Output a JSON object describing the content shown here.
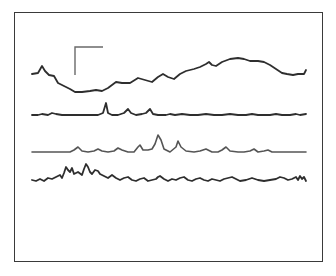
{
  "chart_data": {
    "type": "line",
    "title": "",
    "xlabel": "",
    "ylabel": "",
    "grid": false,
    "legend": null,
    "scale_bar": {
      "x": 75,
      "y_top": 47,
      "y_bottom": 75,
      "x_right": 103
    },
    "series": [
      {
        "name": "trace-1",
        "baseline_y": 74,
        "points": [
          [
            32,
            74
          ],
          [
            38,
            73
          ],
          [
            42,
            66
          ],
          [
            45,
            71
          ],
          [
            49,
            75
          ],
          [
            54,
            76
          ],
          [
            58,
            83
          ],
          [
            64,
            86
          ],
          [
            70,
            89
          ],
          [
            75,
            92
          ],
          [
            82,
            92
          ],
          [
            90,
            91
          ],
          [
            96,
            90
          ],
          [
            102,
            91
          ],
          [
            108,
            88
          ],
          [
            116,
            82
          ],
          [
            122,
            83
          ],
          [
            130,
            83
          ],
          [
            138,
            78
          ],
          [
            145,
            80
          ],
          [
            152,
            82
          ],
          [
            158,
            77
          ],
          [
            163,
            74
          ],
          [
            168,
            77
          ],
          [
            174,
            79
          ],
          [
            180,
            74
          ],
          [
            186,
            71
          ],
          [
            194,
            69
          ],
          [
            200,
            67
          ],
          [
            206,
            64
          ],
          [
            209,
            62
          ],
          [
            212,
            65
          ],
          [
            216,
            66
          ],
          [
            222,
            62
          ],
          [
            230,
            59
          ],
          [
            238,
            58
          ],
          [
            244,
            59
          ],
          [
            250,
            61
          ],
          [
            258,
            61
          ],
          [
            264,
            62
          ],
          [
            270,
            65
          ],
          [
            276,
            69
          ],
          [
            282,
            73
          ],
          [
            287,
            74
          ],
          [
            293,
            75
          ],
          [
            298,
            74
          ],
          [
            304,
            74
          ],
          [
            306,
            70
          ]
        ]
      },
      {
        "name": "trace-2",
        "baseline_y": 115,
        "points": [
          [
            32,
            115
          ],
          [
            38,
            115
          ],
          [
            42,
            114
          ],
          [
            48,
            115
          ],
          [
            52,
            113
          ],
          [
            56,
            114
          ],
          [
            62,
            115
          ],
          [
            70,
            115
          ],
          [
            80,
            115
          ],
          [
            90,
            115
          ],
          [
            98,
            115
          ],
          [
            103,
            113
          ],
          [
            106,
            103
          ],
          [
            108,
            113
          ],
          [
            112,
            115
          ],
          [
            118,
            115
          ],
          [
            124,
            113
          ],
          [
            128,
            109
          ],
          [
            131,
            113
          ],
          [
            136,
            115
          ],
          [
            142,
            114
          ],
          [
            146,
            113
          ],
          [
            150,
            109
          ],
          [
            153,
            114
          ],
          [
            158,
            115
          ],
          [
            166,
            115
          ],
          [
            170,
            114
          ],
          [
            175,
            115
          ],
          [
            182,
            114
          ],
          [
            190,
            115
          ],
          [
            198,
            115
          ],
          [
            206,
            114
          ],
          [
            214,
            115
          ],
          [
            222,
            115
          ],
          [
            230,
            114
          ],
          [
            238,
            115
          ],
          [
            246,
            115
          ],
          [
            252,
            114
          ],
          [
            258,
            115
          ],
          [
            264,
            115
          ],
          [
            270,
            115
          ],
          [
            276,
            114
          ],
          [
            282,
            115
          ],
          [
            290,
            115
          ],
          [
            296,
            114
          ],
          [
            300,
            115
          ],
          [
            306,
            114
          ]
        ]
      },
      {
        "name": "trace-3",
        "baseline_y": 152,
        "points": [
          [
            32,
            152
          ],
          [
            42,
            152
          ],
          [
            52,
            152
          ],
          [
            62,
            152
          ],
          [
            70,
            152
          ],
          [
            74,
            150
          ],
          [
            78,
            147
          ],
          [
            82,
            151
          ],
          [
            88,
            152
          ],
          [
            94,
            151
          ],
          [
            98,
            149
          ],
          [
            102,
            151
          ],
          [
            108,
            152
          ],
          [
            114,
            151
          ],
          [
            118,
            148
          ],
          [
            122,
            150
          ],
          [
            128,
            152
          ],
          [
            134,
            152
          ],
          [
            138,
            147
          ],
          [
            140,
            145
          ],
          [
            143,
            150
          ],
          [
            148,
            150
          ],
          [
            152,
            149
          ],
          [
            155,
            144
          ],
          [
            158,
            135
          ],
          [
            161,
            140
          ],
          [
            164,
            149
          ],
          [
            170,
            152
          ],
          [
            176,
            147
          ],
          [
            178,
            141
          ],
          [
            181,
            147
          ],
          [
            186,
            151
          ],
          [
            194,
            152
          ],
          [
            200,
            151
          ],
          [
            206,
            149
          ],
          [
            212,
            152
          ],
          [
            218,
            152
          ],
          [
            222,
            150
          ],
          [
            226,
            147
          ],
          [
            230,
            151
          ],
          [
            238,
            152
          ],
          [
            244,
            152
          ],
          [
            250,
            151
          ],
          [
            254,
            149
          ],
          [
            258,
            152
          ],
          [
            264,
            151
          ],
          [
            268,
            150
          ],
          [
            272,
            152
          ],
          [
            280,
            152
          ],
          [
            290,
            152
          ],
          [
            300,
            152
          ],
          [
            306,
            152
          ]
        ]
      },
      {
        "name": "trace-4",
        "baseline_y": 180,
        "points": [
          [
            32,
            180
          ],
          [
            36,
            181
          ],
          [
            40,
            179
          ],
          [
            44,
            181
          ],
          [
            48,
            178
          ],
          [
            52,
            179
          ],
          [
            56,
            177
          ],
          [
            60,
            175
          ],
          [
            62,
            178
          ],
          [
            64,
            173
          ],
          [
            66,
            167
          ],
          [
            68,
            170
          ],
          [
            70,
            172
          ],
          [
            72,
            168
          ],
          [
            74,
            174
          ],
          [
            78,
            172
          ],
          [
            82,
            175
          ],
          [
            84,
            169
          ],
          [
            86,
            164
          ],
          [
            88,
            167
          ],
          [
            90,
            172
          ],
          [
            92,
            174
          ],
          [
            95,
            170
          ],
          [
            98,
            171
          ],
          [
            100,
            174
          ],
          [
            104,
            176
          ],
          [
            108,
            178
          ],
          [
            112,
            175
          ],
          [
            116,
            178
          ],
          [
            120,
            180
          ],
          [
            124,
            178
          ],
          [
            128,
            177
          ],
          [
            132,
            180
          ],
          [
            136,
            181
          ],
          [
            140,
            179
          ],
          [
            144,
            178
          ],
          [
            148,
            181
          ],
          [
            152,
            180
          ],
          [
            156,
            179
          ],
          [
            158,
            177
          ],
          [
            160,
            176
          ],
          [
            164,
            179
          ],
          [
            168,
            181
          ],
          [
            172,
            179
          ],
          [
            176,
            180
          ],
          [
            180,
            178
          ],
          [
            184,
            177
          ],
          [
            188,
            180
          ],
          [
            192,
            181
          ],
          [
            196,
            179
          ],
          [
            200,
            178
          ],
          [
            204,
            180
          ],
          [
            208,
            181
          ],
          [
            212,
            179
          ],
          [
            216,
            180
          ],
          [
            220,
            181
          ],
          [
            224,
            179
          ],
          [
            228,
            178
          ],
          [
            232,
            177
          ],
          [
            236,
            179
          ],
          [
            240,
            181
          ],
          [
            246,
            180
          ],
          [
            252,
            178
          ],
          [
            258,
            180
          ],
          [
            264,
            181
          ],
          [
            270,
            180
          ],
          [
            276,
            179
          ],
          [
            280,
            177
          ],
          [
            284,
            178
          ],
          [
            288,
            180
          ],
          [
            292,
            179
          ],
          [
            296,
            177
          ],
          [
            298,
            180
          ],
          [
            300,
            176
          ],
          [
            302,
            179
          ],
          [
            304,
            177
          ],
          [
            306,
            181
          ]
        ]
      }
    ]
  }
}
